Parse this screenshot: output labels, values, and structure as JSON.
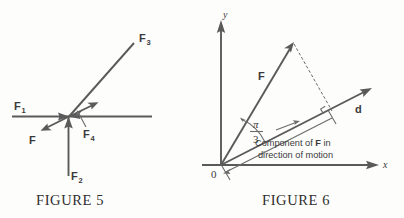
{
  "figures": [
    {
      "id": "figure-5",
      "caption": "FIGURE 5",
      "labels": {
        "f1": "F",
        "f1_sub": "1",
        "f2": "F",
        "f2_sub": "2",
        "f3": "F",
        "f3_sub": "3",
        "f4": "F",
        "f4_sub": "4",
        "f": "F"
      }
    },
    {
      "id": "figure-6",
      "caption": "FIGURE 6",
      "labels": {
        "y_axis": "y",
        "x_axis": "x",
        "origin": "0",
        "force": "F",
        "displacement": "d",
        "angle_numerator": "π",
        "angle_denominator": "3",
        "annotation_line1_part1": "Component of ",
        "annotation_line1_bold": "F",
        "annotation_line1_part2": " in",
        "annotation_line2": "direction of motion"
      }
    }
  ],
  "colors": {
    "ink": "#5a5a5a",
    "ink_light": "#6b6b6b",
    "text": "#3a3a3a",
    "background": "#fdfdfc"
  }
}
